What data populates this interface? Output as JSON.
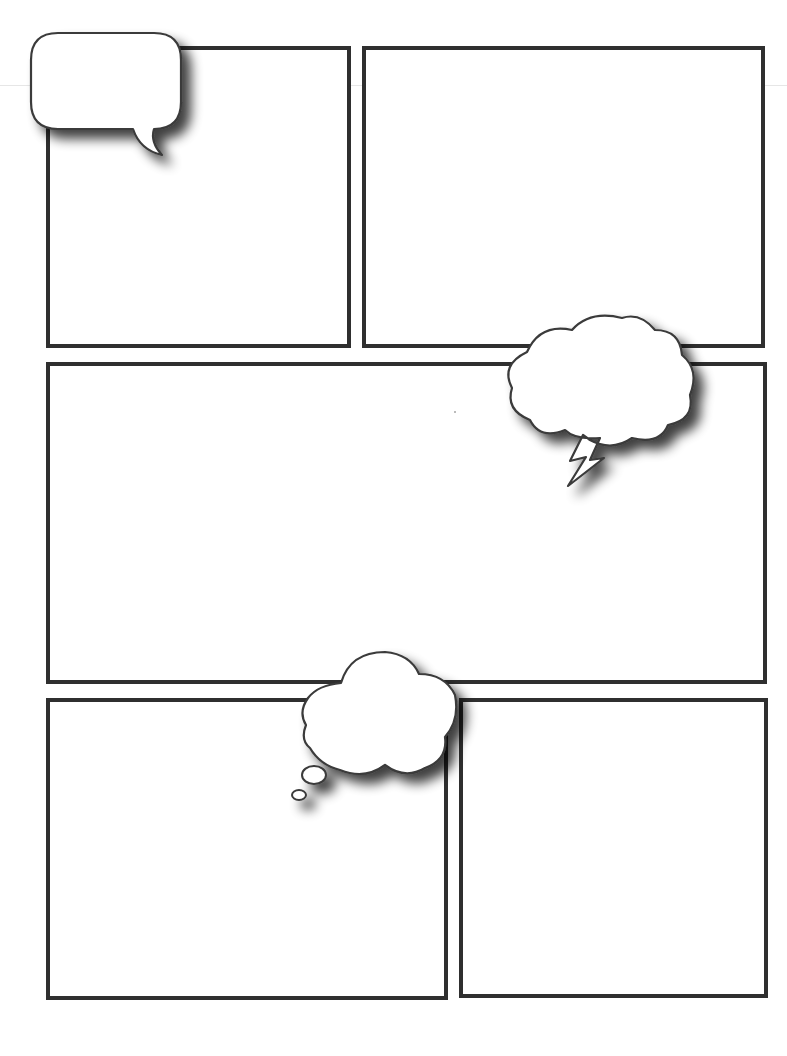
{
  "page": {
    "type": "blank comic book page template",
    "background": "#ffffff",
    "border_color": "#2f2f2f"
  },
  "panels": [
    {
      "id": "panel-1",
      "label": "",
      "x": 46,
      "y": 46,
      "w": 305,
      "h": 302
    },
    {
      "id": "panel-2",
      "label": "",
      "x": 362,
      "y": 46,
      "w": 403,
      "h": 302
    },
    {
      "id": "panel-3",
      "label": "",
      "x": 46,
      "y": 362,
      "w": 721,
      "h": 322
    },
    {
      "id": "panel-4",
      "label": "",
      "x": 46,
      "y": 698,
      "w": 402,
      "h": 302
    },
    {
      "id": "panel-5",
      "label": "",
      "x": 459,
      "y": 698,
      "w": 309,
      "h": 300
    }
  ],
  "bubbles": [
    {
      "id": "speech-bubble",
      "kind": "speech",
      "text": ""
    },
    {
      "id": "shout-bubble",
      "kind": "cloud-with-lightning-tail",
      "text": ""
    },
    {
      "id": "thought-bubble",
      "kind": "thought-cloud",
      "text": ""
    }
  ]
}
